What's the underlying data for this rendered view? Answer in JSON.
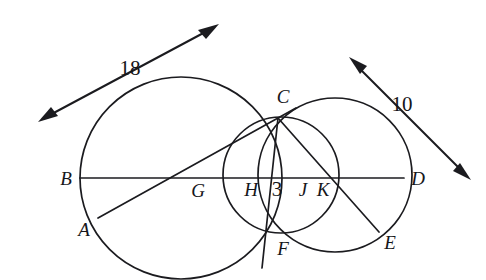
{
  "figure": {
    "background_color": "#ffffff",
    "ink_color": "#1b1b1f",
    "width": 486,
    "height": 280
  },
  "point_labels": [
    {
      "id": "A",
      "text": "A",
      "x": 84,
      "y": 229,
      "style": "italic"
    },
    {
      "id": "B",
      "text": "B",
      "x": 66,
      "y": 178,
      "style": "italic"
    },
    {
      "id": "C",
      "text": "C",
      "x": 283,
      "y": 96,
      "style": "italic"
    },
    {
      "id": "D",
      "text": "D",
      "x": 418,
      "y": 178,
      "style": "italic"
    },
    {
      "id": "E",
      "text": "E",
      "x": 390,
      "y": 242,
      "style": "italic"
    },
    {
      "id": "F",
      "text": "F",
      "x": 283,
      "y": 248,
      "style": "italic"
    },
    {
      "id": "G",
      "text": "G",
      "x": 198,
      "y": 190,
      "style": "italic"
    },
    {
      "id": "H",
      "text": "H",
      "x": 251,
      "y": 189,
      "style": "italic"
    },
    {
      "id": "J",
      "text": "J",
      "x": 303,
      "y": 189,
      "style": "italic"
    },
    {
      "id": "K",
      "text": "K",
      "x": 323,
      "y": 189,
      "style": "italic"
    }
  ],
  "measure_labels": [
    {
      "id": "seg-HJ",
      "text": "3",
      "x": 277,
      "y": 189
    },
    {
      "id": "arrow-left",
      "text": "18",
      "x": 130,
      "y": 68
    },
    {
      "id": "arrow-right",
      "text": "10",
      "x": 402,
      "y": 104
    }
  ],
  "circles": [
    {
      "id": "large-circle",
      "cx": 181,
      "cy": 178,
      "r": 101
    },
    {
      "id": "small-lens-circle",
      "cx": 281,
      "cy": 175,
      "r": 58
    },
    {
      "id": "right-circle",
      "cx": 335,
      "cy": 175,
      "r": 77
    }
  ],
  "segments": [
    {
      "id": "secant-BD",
      "x1": 80,
      "y1": 178,
      "x2": 404,
      "y2": 178
    },
    {
      "id": "secant-ACx",
      "x1": 98,
      "y1": 218,
      "x2": 296,
      "y2": 108
    },
    {
      "id": "chord-CE",
      "x1": 278,
      "y1": 118,
      "x2": 379,
      "y2": 232
    },
    {
      "id": "chord-CF",
      "x1": 278,
      "y1": 118,
      "x2": 262,
      "y2": 268
    }
  ],
  "arrows": [
    {
      "id": "measure-arrow-18",
      "x1": 38,
      "y1": 122,
      "x2": 219,
      "y2": 24,
      "double": true
    },
    {
      "id": "measure-arrow-10",
      "x1": 349,
      "y1": 57,
      "x2": 471,
      "y2": 180,
      "double": true
    }
  ]
}
